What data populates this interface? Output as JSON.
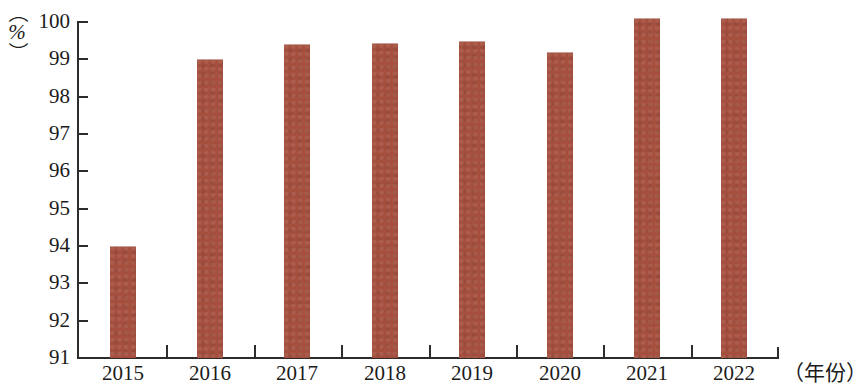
{
  "chart_data": {
    "type": "bar",
    "title": "",
    "subtitle": "",
    "xlabel": "（年份）",
    "ylabel": "（%）",
    "categories": [
      "2015",
      "2016",
      "2017",
      "2018",
      "2019",
      "2020",
      "2021",
      "2022"
    ],
    "values": [
      94.0,
      99.0,
      99.4,
      99.45,
      99.5,
      99.2,
      100.1,
      100.1
    ],
    "series": [
      {
        "name": "",
        "values": [
          94.0,
          99.0,
          99.4,
          99.45,
          99.5,
          99.2,
          100.1,
          100.1
        ]
      }
    ],
    "ylim": [
      91,
      100
    ],
    "ytick_labels": [
      "100",
      "99",
      "98",
      "97",
      "96",
      "95",
      "94",
      "93",
      "92",
      "91"
    ],
    "ytick_values": [
      100,
      99,
      98,
      97,
      96,
      95,
      94,
      93,
      92,
      91
    ],
    "grid": false,
    "legend": null,
    "legend_position": "none",
    "annotations": [],
    "bar_color": "#a5503f",
    "axis_color": "#2c2c2c",
    "background_color": "#ffffff"
  },
  "axes": {
    "y_unit_open_paren": "（",
    "y_unit_symbol": "%",
    "y_unit_close_paren": "）",
    "x_unit": "（年份）"
  }
}
